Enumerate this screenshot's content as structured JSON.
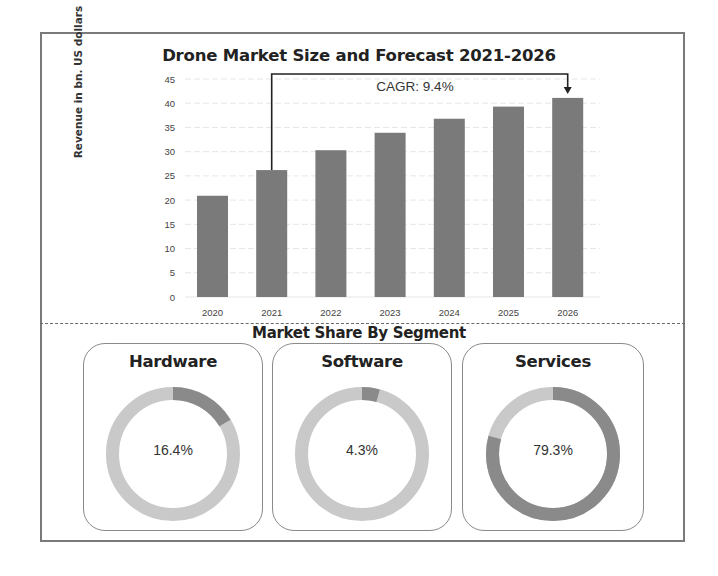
{
  "chart_data": [
    {
      "type": "bar",
      "title": "Drone Market Size and Forecast 2021-2026",
      "xlabel": "",
      "ylabel": "Revenue in bn. US dollars",
      "categories": [
        "2020",
        "2021",
        "2022",
        "2023",
        "2024",
        "2025",
        "2026"
      ],
      "values": [
        20.9,
        26.2,
        30.3,
        33.9,
        36.8,
        39.3,
        41.1
      ],
      "ylim": [
        0,
        45
      ],
      "yticks": [
        0,
        5,
        10,
        15,
        20,
        25,
        30,
        35,
        40,
        45
      ],
      "grid": true,
      "legend": null,
      "annotations": [
        {
          "text": "CAGR: 9.4%",
          "from": "2021",
          "to": "2026",
          "style": "bracket-arrow"
        }
      ],
      "colors": {
        "bar": "#7a7a7a"
      }
    },
    {
      "type": "pie",
      "title": "Market Share By Segment",
      "subcharts": [
        {
          "label": "Hardware",
          "value": 16.4,
          "unit": "%",
          "style": "donut"
        },
        {
          "label": "Software",
          "value": 4.3,
          "unit": "%",
          "style": "donut"
        },
        {
          "label": "Services",
          "value": 79.3,
          "unit": "%",
          "style": "donut"
        }
      ],
      "colors": {
        "highlight": "#8a8a8a",
        "remainder": "#c9c9c9"
      }
    }
  ],
  "header": {
    "title": "Drone Market Size and Forecast 2021-2026"
  },
  "bar_chart": {
    "ylabel": "Revenue in bn. US dollars",
    "cagr_label": "CAGR: 9.4%",
    "yticks": [
      "0",
      "5",
      "10",
      "15",
      "20",
      "25",
      "30",
      "35",
      "40",
      "45"
    ],
    "categories": [
      "2020",
      "2021",
      "2022",
      "2023",
      "2024",
      "2025",
      "2026"
    ],
    "values": [
      20.9,
      26.2,
      30.3,
      33.9,
      36.8,
      39.3,
      41.1
    ],
    "ymax": 45,
    "bar_color": "#7a7a7a",
    "grid_color": "#e6e6e6"
  },
  "segments": {
    "title": "Market Share By Segment",
    "items": [
      {
        "label": "Hardware",
        "value": 16.4,
        "value_label": "16.4%"
      },
      {
        "label": "Software",
        "value": 4.3,
        "value_label": "4.3%"
      },
      {
        "label": "Services",
        "value": 79.3,
        "value_label": "79.3%"
      }
    ],
    "highlight_color": "#8a8a8a",
    "remainder_color": "#c9c9c9"
  }
}
